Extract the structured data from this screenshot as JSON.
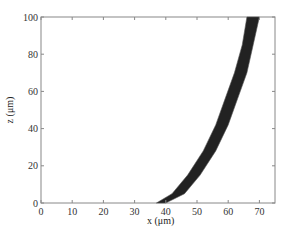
{
  "chart_data": {
    "type": "area",
    "title": "",
    "xlabel": "x (μm)",
    "ylabel": "z (μm)",
    "xlim": [
      0,
      75
    ],
    "ylim": [
      0,
      100
    ],
    "xticks": [
      "0",
      "10",
      "20",
      "30",
      "40",
      "50",
      "60",
      "70"
    ],
    "yticks": [
      "0",
      "20",
      "40",
      "60",
      "80",
      "100"
    ],
    "grid": false,
    "legend": null,
    "series": [
      {
        "name": "inner edge",
        "x": [
          37,
          42,
          47,
          52,
          56,
          59,
          62,
          64.5,
          66
        ],
        "z": [
          0,
          5,
          15,
          28,
          42,
          56,
          70,
          85,
          100
        ]
      },
      {
        "name": "outer edge",
        "x": [
          40,
          46,
          51,
          56,
          60,
          63,
          66,
          68,
          70
        ],
        "z": [
          0,
          5,
          15,
          28,
          42,
          56,
          70,
          85,
          100
        ]
      }
    ],
    "color": "#222222"
  }
}
